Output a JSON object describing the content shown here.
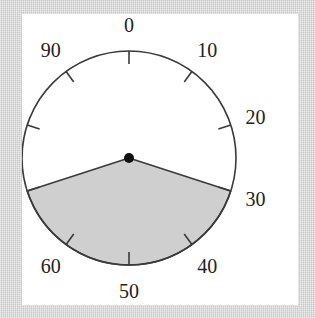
{
  "figure": {
    "type": "circular-dial",
    "title": "",
    "center_dot": {
      "cx": 107,
      "cy": 144,
      "r": 5,
      "color": "#111111"
    },
    "circle": {
      "cx": 107,
      "cy": 144,
      "r": 107,
      "stroke": "#3a3a3a",
      "stroke_width": 1.6,
      "fill": "#ffffff"
    },
    "colors": {
      "page_background": "#d2d2d2",
      "card_background": "#ffffff",
      "outline": "#3a3a3a",
      "sector_fill": "#cfcfcf",
      "sector_stroke": "#3a3a3a",
      "label_text": "#222222",
      "center_dot": "#111111"
    },
    "scale": {
      "units_full_turn": 100,
      "tick_step": 10,
      "start_at_top": true,
      "direction": "clockwise"
    },
    "sector": {
      "start_value": 30,
      "end_value": 70,
      "span_values": 40,
      "span_degrees": 144,
      "fill": "#cfcfcf",
      "label": ""
    },
    "ticks": [
      {
        "value": "0",
        "angle_deg": 0,
        "label_x": 107,
        "label_y": 24,
        "anchor": "middle"
      },
      {
        "value": "10",
        "angle_deg": 36,
        "label_x": 175,
        "label_y": 46,
        "anchor": "middle"
      },
      {
        "value": "20",
        "angle_deg": 72,
        "label_x": 228,
        "label_y": 110,
        "anchor": "start"
      },
      {
        "value": "30",
        "angle_deg": 108,
        "label_x": 228,
        "label_y": 188,
        "anchor": "start"
      },
      {
        "value": "40",
        "angle_deg": 144,
        "label_x": 182,
        "label_y": 256,
        "anchor": "middle"
      },
      {
        "value": "50",
        "angle_deg": 180,
        "label_x": 107,
        "label_y": 278,
        "anchor": "middle"
      },
      {
        "value": "60",
        "angle_deg": 216,
        "label_x": 34,
        "label_y": 256,
        "anchor": "middle"
      },
      {
        "value": "70",
        "angle_deg": 252,
        "label_x": -12,
        "label_y": 188,
        "anchor": "start"
      },
      {
        "value": "80",
        "angle_deg": 288,
        "label_x": -12,
        "label_y": 110,
        "anchor": "start"
      },
      {
        "value": "90",
        "angle_deg": 324,
        "label_x": 40,
        "label_y": 46,
        "anchor": "middle"
      }
    ]
  }
}
